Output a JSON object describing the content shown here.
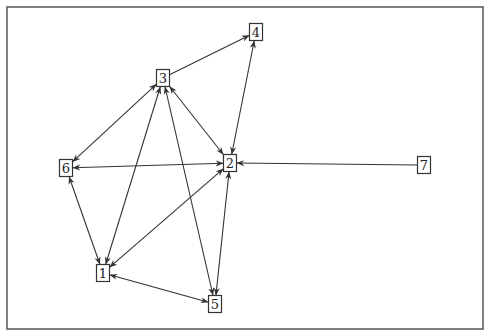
{
  "diagram": {
    "type": "directed-graph",
    "frame": {
      "x": 7,
      "y": 7,
      "width": 476,
      "height": 322
    },
    "colors": {
      "edge": "#333333",
      "node_border": "#333333",
      "node_fill": "#ffffff",
      "frame": "#555555"
    },
    "nodes": [
      {
        "id": "1",
        "label": "1",
        "x": 103,
        "y": 273
      },
      {
        "id": "2",
        "label": "2",
        "x": 230,
        "y": 163
      },
      {
        "id": "3",
        "label": "3",
        "x": 163,
        "y": 78
      },
      {
        "id": "4",
        "label": "4",
        "x": 256,
        "y": 32
      },
      {
        "id": "5",
        "label": "5",
        "x": 215,
        "y": 304
      },
      {
        "id": "6",
        "label": "6",
        "x": 66,
        "y": 168
      },
      {
        "id": "7",
        "label": "7",
        "x": 424,
        "y": 165
      }
    ],
    "edges": [
      {
        "from": "3",
        "to": "4",
        "bidirectional": false
      },
      {
        "from": "2",
        "to": "4",
        "bidirectional": true
      },
      {
        "from": "3",
        "to": "6",
        "bidirectional": true
      },
      {
        "from": "3",
        "to": "2",
        "bidirectional": true
      },
      {
        "from": "3",
        "to": "1",
        "bidirectional": true
      },
      {
        "from": "3",
        "to": "5",
        "bidirectional": true
      },
      {
        "from": "6",
        "to": "2",
        "bidirectional": true
      },
      {
        "from": "6",
        "to": "1",
        "bidirectional": true
      },
      {
        "from": "7",
        "to": "2",
        "bidirectional": false
      },
      {
        "from": "1",
        "to": "2",
        "bidirectional": true
      },
      {
        "from": "2",
        "to": "5",
        "bidirectional": true
      },
      {
        "from": "1",
        "to": "5",
        "bidirectional": true
      }
    ]
  }
}
